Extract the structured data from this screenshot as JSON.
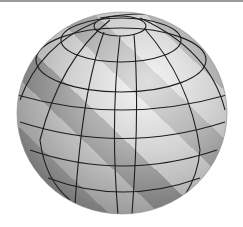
{
  "image": {
    "subject": "Shaded 3D sphere with latitude/longitude grid lines",
    "caption": "Grey globe with grid",
    "colors": {
      "background": "#ffffff",
      "sphere_light": "#e2e2e2",
      "sphere_mid": "#a8a8a8",
      "sphere_dark": "#6e6e6e",
      "grid_line": "#1e1e1e",
      "top_border": "#9a9a9a"
    }
  }
}
